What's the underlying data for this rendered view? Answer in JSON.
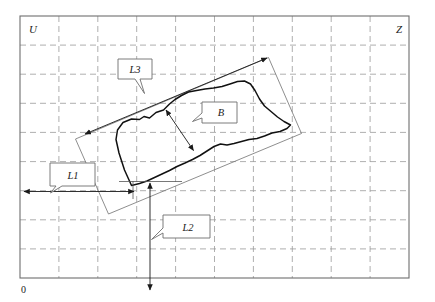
{
  "figure": {
    "background_color": "#ffffff",
    "frame_color": "#6e6e6e",
    "grid_color": "#9a9a9a",
    "contour_color": "#111111",
    "dimension_color": "#1a1a1a"
  },
  "axes": {
    "vertical_axis_label": "U",
    "horizontal_axis_label": "Z",
    "origin_label": "0"
  },
  "callouts": [
    {
      "id": "L3",
      "label": "L3",
      "points_to": "long-diagonal-dimension"
    },
    {
      "id": "B",
      "label": "B",
      "points_to": "short-width-dimension"
    },
    {
      "id": "L1",
      "label": "L1",
      "points_to": "horizontal-offset-dimension"
    },
    {
      "id": "L2",
      "label": "L2",
      "points_to": "vertical-offset-dimension"
    }
  ],
  "dimensions": [
    {
      "name": "L3",
      "kind": "double-arrow",
      "orientation": "diagonal",
      "description": "length of rotated bounding box"
    },
    {
      "name": "B",
      "kind": "double-arrow",
      "orientation": "diagonal",
      "description": "width of rotated bounding box"
    },
    {
      "name": "L1",
      "kind": "double-arrow",
      "orientation": "horizontal",
      "description": "distance from vertical axis to contour reference point"
    },
    {
      "name": "L2",
      "kind": "double-arrow",
      "orientation": "vertical",
      "description": "distance from horizontal axis to contour reference point"
    }
  ],
  "grid": {
    "columns": 10,
    "rows": 9,
    "style": "dashed"
  }
}
